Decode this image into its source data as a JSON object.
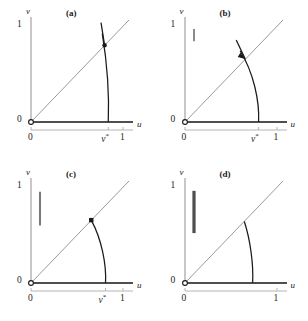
{
  "figure": {
    "type": "multi-panel-phase-plane",
    "panels_across": 2,
    "panels_down": 2,
    "background_color": "#ffffff",
    "curve_color": "#1a1a1a",
    "guide_color": "#9a9a9a",
    "axis_color": "#151515",
    "bar_color": "#4d4d4d"
  },
  "axes": {
    "x_name": "u",
    "y_name": "v",
    "y_tick_top": "1",
    "y_tick_bottom": "0",
    "x_tick_zero": "0",
    "x_tick_one": "1",
    "x_tick_star_text": "v*",
    "x_tick_star_base": "v",
    "x_tick_star_sup": "*",
    "x_range": [
      0,
      1
    ],
    "y_range": [
      0,
      1
    ]
  },
  "panels": [
    {
      "id": "a",
      "label": "(a)",
      "has_vstar_label": true,
      "vstar_value": 0.84,
      "bar": null,
      "marker": {
        "type": "dot",
        "u": 0.8,
        "v": 0.8
      },
      "curve_crosses_diagonal": true,
      "curve_top_u": 0.775,
      "curve_top_v": 0.92,
      "curve_bottom_u": 0.84,
      "curve_bottom_v": 0.0
    },
    {
      "id": "b",
      "label": "(b)",
      "has_vstar_label": true,
      "vstar_value": 0.8,
      "bar": {
        "v_from": 0.84,
        "v_to": 0.97,
        "thickness": 1.3
      },
      "marker": {
        "type": "arrowhead",
        "u": 0.655,
        "v": 0.655
      },
      "curve_crosses_diagonal": true,
      "curve_top_u": 0.6,
      "curve_top_v": 0.74,
      "curve_bottom_u": 0.8,
      "curve_bottom_v": 0.0
    },
    {
      "id": "c",
      "label": "(c)",
      "has_vstar_label": true,
      "vstar_value": 0.81,
      "bar": {
        "v_from": 0.6,
        "v_to": 0.95,
        "thickness": 1.5
      },
      "marker": {
        "type": "square",
        "u": 0.655,
        "v": 0.655
      },
      "curve_crosses_diagonal": false,
      "curve_top_u": 0.655,
      "curve_top_v": 0.655,
      "curve_bottom_u": 0.81,
      "curve_bottom_v": 0.0
    },
    {
      "id": "d",
      "label": "(d)",
      "has_vstar_label": false,
      "vstar_value": null,
      "bar": {
        "v_from": 0.52,
        "v_to": 0.96,
        "thickness": 3.2
      },
      "marker": null,
      "curve_crosses_diagonal": false,
      "curve_top_u": 0.645,
      "curve_top_v": 0.64,
      "curve_bottom_u": 0.735,
      "curve_bottom_v": 0.0
    }
  ]
}
